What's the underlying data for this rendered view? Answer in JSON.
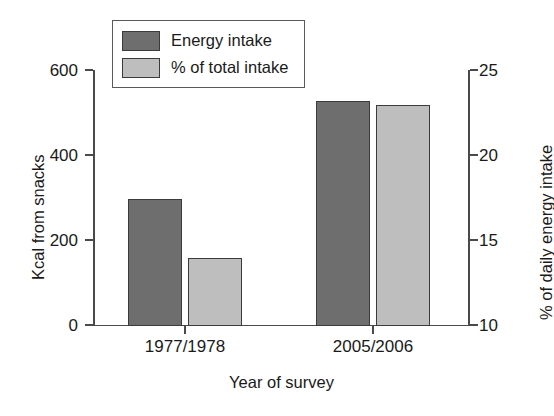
{
  "chart_data": {
    "type": "bar",
    "title": "",
    "categories": [
      "1977/1978",
      "2005/2006"
    ],
    "xlabel": "Year of survey",
    "ylabel": "Kcal from snacks",
    "ylabel_right": "% of daily energy intake",
    "ylim": [
      0,
      600
    ],
    "ylim_right": [
      10,
      25
    ],
    "yticks": [
      0,
      200,
      400,
      600
    ],
    "yticks_right": [
      10,
      15,
      20,
      25
    ],
    "ytick_labels": [
      "0",
      "200",
      "400",
      "600"
    ],
    "ytick_labels_right": [
      "10",
      "15",
      "20",
      "25"
    ],
    "grid": false,
    "legend_position": "upper left",
    "series": [
      {
        "name": "Energy intake",
        "axis": "left",
        "color": "#6e6e6e",
        "values": [
          300,
          530
        ],
        "units": "kcal"
      },
      {
        "name": "% of total intake",
        "axis": "right",
        "color": "#bebebe",
        "values": [
          14,
          23
        ],
        "units": "%"
      }
    ]
  },
  "legend": {
    "items": [
      {
        "label": "Energy intake",
        "color": "#6e6e6e"
      },
      {
        "label": "% of total intake",
        "color": "#bebebe"
      }
    ]
  },
  "colors": {
    "dark_bar": "#6e6e6e",
    "light_bar": "#bebebe",
    "bar_edge": "#3b3b3b",
    "axis": "#4a4a4a",
    "text": "#1a1a1a",
    "background": "#ffffff"
  }
}
